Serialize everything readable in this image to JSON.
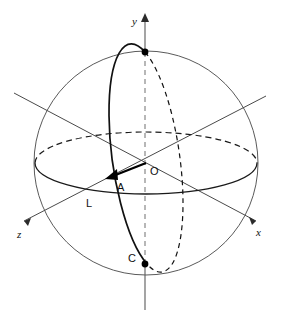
{
  "figure": {
    "background_color": "#ffffff",
    "stroke_color": "#111111"
  },
  "axes": [
    {
      "key": "y",
      "label": "y",
      "style": "italic",
      "direction": "up",
      "label_x": 132,
      "label_y": 25
    },
    {
      "key": "x",
      "label": "x",
      "style": "italic",
      "direction": "lower-right",
      "label_x": 256,
      "label_y": 236
    },
    {
      "key": "z",
      "label": "z",
      "style": "italic",
      "direction": "lower-left",
      "label_x": 17,
      "label_y": 238
    }
  ],
  "points": [
    {
      "key": "O",
      "label": "O",
      "role": "origin",
      "label_x": 150,
      "label_y": 175,
      "dot": false
    },
    {
      "key": "A",
      "label": "A",
      "role": "vector-endpoint",
      "label_x": 117,
      "label_y": 191,
      "dot": false
    },
    {
      "key": "L",
      "label": "L",
      "role": "equator-crossing",
      "label_x": 86,
      "label_y": 207,
      "dot": false
    },
    {
      "key": "C",
      "label": "C",
      "role": "south-pole",
      "label_x": 128,
      "label_y": 262,
      "dot": true
    },
    {
      "key": "N",
      "label": "",
      "role": "north-pole",
      "label_x": 0,
      "label_y": 0,
      "dot": true
    }
  ],
  "geometry": {
    "center": {
      "x": 146,
      "y": 163
    },
    "sphere_radius": 112,
    "equator": {
      "rx": 111,
      "ry": 31
    },
    "meridian": {
      "rx": 31,
      "ry": 106,
      "rotation_deg": -8
    },
    "north_pole": {
      "x": 145,
      "y": 52
    },
    "south_pole": {
      "x": 145,
      "y": 264
    },
    "vector_tip": {
      "x": 108,
      "y": 178
    }
  },
  "line_styles": {
    "hidden": "dashed",
    "visible": "solid"
  }
}
